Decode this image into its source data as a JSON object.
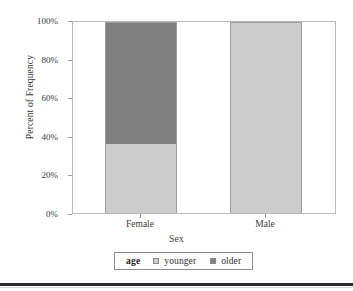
{
  "chart_data": {
    "type": "bar",
    "stacked": true,
    "normalized": true,
    "title": "",
    "subtitle": "",
    "xlabel": "Sex",
    "ylabel": "Percent of Frequency",
    "categories": [
      "Female",
      "Male"
    ],
    "series": [
      {
        "name": "younger",
        "values": [
          36,
          100
        ],
        "color": "#cccccc"
      },
      {
        "name": "older",
        "values": [
          64,
          0
        ],
        "color": "#808080"
      }
    ],
    "ylim": [
      0,
      100
    ],
    "yticks": [
      0,
      20,
      40,
      60,
      80,
      100
    ],
    "ytick_labels": [
      "0%",
      "20%",
      "40%",
      "60%",
      "80%",
      "100%"
    ],
    "grid": false,
    "legend": {
      "position": "bottom",
      "title": "age",
      "entries": [
        {
          "label": "younger",
          "color": "#cccccc"
        },
        {
          "label": "older",
          "color": "#808080"
        }
      ]
    },
    "annotations": []
  },
  "axes": {
    "y_title": "Percent of Frequency",
    "x_title": "Sex",
    "y_tick_labels": [
      "100%",
      "80%",
      "60%",
      "40%",
      "20%",
      "0%"
    ],
    "x_tick_labels": [
      "Female",
      "Male"
    ]
  },
  "legend": {
    "title": "age",
    "items": [
      {
        "label": "younger"
      },
      {
        "label": "older"
      }
    ]
  },
  "colors": {
    "younger": "#cccccc",
    "older": "#808080",
    "frame": "#b9b9b9",
    "text": "#3a3a3a",
    "rule": "#2b2b2b"
  }
}
